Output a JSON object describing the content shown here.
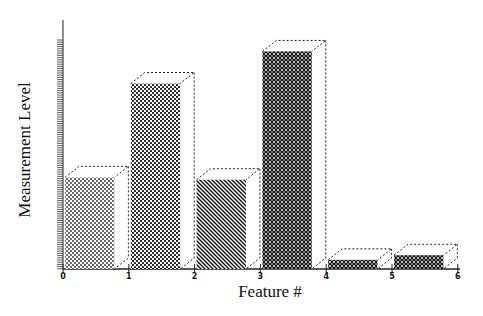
{
  "chart_data": {
    "type": "bar",
    "style": "3d-hatched",
    "title": "",
    "xlabel": "Feature #",
    "ylabel": "Measurement Level",
    "x_ticks": [
      "0",
      "1",
      "2",
      "3",
      "4",
      "5",
      "6"
    ],
    "categories": [
      "0-1",
      "1-2",
      "2-3",
      "3-4",
      "4-5",
      "5-6"
    ],
    "values": [
      40,
      81,
      39,
      95,
      4,
      6
    ],
    "ylim": [
      0,
      100
    ],
    "y_tick_labels": [],
    "grid": false,
    "legend": null,
    "patterns": [
      "fine-dots",
      "dots",
      "diagonal-hatch",
      "cross-hatch",
      "cross-hatch",
      "cross-hatch"
    ]
  },
  "axes": {
    "x_label": "Feature #",
    "y_label": "Measurement Level",
    "ticks": [
      "0",
      "1",
      "2",
      "3",
      "4",
      "5",
      "6"
    ]
  }
}
